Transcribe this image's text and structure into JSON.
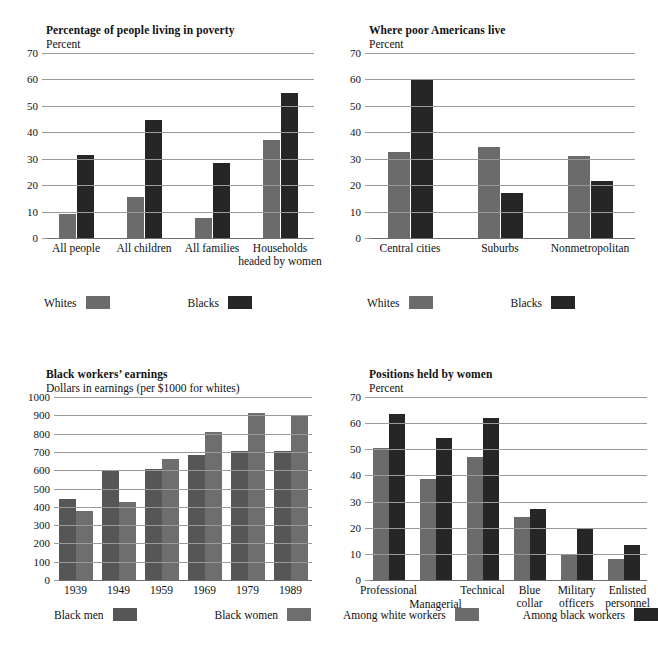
{
  "page": {
    "background": "#ffffff",
    "orientation": "4-panel figure grid"
  },
  "palette": {
    "light_gray": "#6b6b6b",
    "dark": "#262626",
    "mid_dark": "#565656",
    "mid_light": "#6e6e6e",
    "gridline": "#9a9a9a"
  },
  "charts": [
    {
      "id": "poverty",
      "chart_data": {
        "type": "bar",
        "title": "Percentage of people living in poverty",
        "subtitle": "Percent",
        "ylabel": "Percent",
        "xlabel": "",
        "ylim": [
          0,
          70
        ],
        "yticks": [
          0,
          10,
          20,
          30,
          40,
          50,
          60,
          70
        ],
        "grid": true,
        "legend_position": "below",
        "categories": [
          "All people",
          "All children",
          "All families",
          "Households\nheaded by women"
        ],
        "series": [
          {
            "name": "Whites",
            "color": "#6b6b6b",
            "values": [
              9,
              15.5,
              7.5,
              37
            ]
          },
          {
            "name": "Blacks",
            "color": "#262626",
            "values": [
              31.5,
              44.5,
              28.5,
              55
            ]
          }
        ]
      }
    },
    {
      "id": "where-poor-live",
      "chart_data": {
        "type": "bar",
        "title": "Where poor Americans live",
        "subtitle": "Percent",
        "ylabel": "Percent",
        "xlabel": "",
        "ylim": [
          0,
          70
        ],
        "yticks": [
          0,
          10,
          20,
          30,
          40,
          50,
          60,
          70
        ],
        "grid": true,
        "legend_position": "below",
        "categories": [
          "Central cities",
          "Suburbs",
          "Nonmetropolitan"
        ],
        "series": [
          {
            "name": "Whites",
            "color": "#6b6b6b",
            "values": [
              32.5,
              34.5,
              31
            ]
          },
          {
            "name": "Blacks",
            "color": "#262626",
            "values": [
              60,
              17,
              21.5
            ]
          }
        ]
      }
    },
    {
      "id": "black-workers-earnings",
      "chart_data": {
        "type": "bar",
        "title": "Black workers’ earnings",
        "subtitle": "Dollars in earnings (per $1000 for whites)",
        "ylabel": "Dollars in earnings (per $1000 for whites)",
        "xlabel": "",
        "ylim": [
          0,
          1000
        ],
        "yticks": [
          0,
          100,
          200,
          300,
          400,
          500,
          600,
          700,
          800,
          900,
          1000
        ],
        "grid": true,
        "legend_position": "below",
        "categories": [
          "1939",
          "1949",
          "1959",
          "1969",
          "1979",
          "1989"
        ],
        "series": [
          {
            "name": "Black men",
            "color": "#565656",
            "values": [
              445,
              595,
              608,
              685,
              705,
              705
            ]
          },
          {
            "name": "Black women",
            "color": "#6e6e6e",
            "values": [
              375,
              428,
              660,
              808,
              915,
              903
            ]
          }
        ]
      }
    },
    {
      "id": "positions-held-by-women",
      "chart_data": {
        "type": "bar",
        "title": "Positions held by women",
        "subtitle": "Percent",
        "ylabel": "Percent",
        "xlabel": "",
        "ylim": [
          0,
          70
        ],
        "yticks": [
          0,
          10,
          20,
          30,
          40,
          50,
          60,
          70
        ],
        "grid": true,
        "legend_position": "below",
        "categories": [
          "Professional",
          "Managerial",
          "Technical",
          "Blue\ncollar",
          "Military\nofficers",
          "Enlisted\npersonnel"
        ],
        "series": [
          {
            "name": "Among white workers",
            "color": "#6b6b6b",
            "values": [
              50.5,
              38.5,
              47,
              24,
              9.5,
              8
            ]
          },
          {
            "name": "Among black workers",
            "color": "#262626",
            "values": [
              63.5,
              54.5,
              62,
              27,
              19.5,
              13.5
            ]
          }
        ]
      }
    }
  ]
}
